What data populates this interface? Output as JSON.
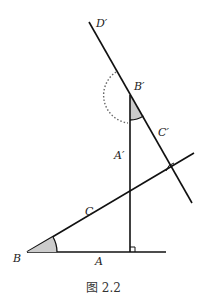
{
  "figure": {
    "caption": "图 2.2",
    "labels": {
      "D_prime": "D′",
      "B_prime": "B′",
      "C_prime": "C′",
      "A_prime": "A′",
      "C": "C",
      "B": "B",
      "A": "A"
    },
    "colors": {
      "line": "#111111",
      "angle_fill": "#cccccc",
      "dotted_arc": "#666666"
    }
  }
}
